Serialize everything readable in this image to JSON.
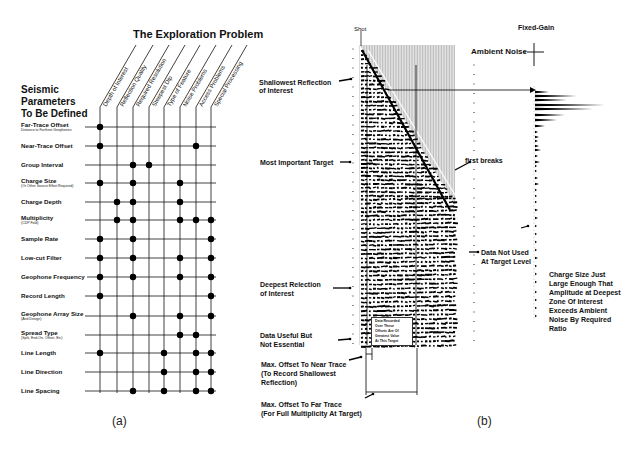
{
  "panel_a": {
    "title": "The Exploration Problem",
    "side_title": [
      "Seismic",
      "Parameters",
      "To Be Defined"
    ],
    "caption": "(a)",
    "columns": [
      {
        "label": "Depth of Interest",
        "x": 100
      },
      {
        "label": "Reflection Quality",
        "x": 117
      },
      {
        "label": "Required Resolution",
        "x": 133
      },
      {
        "label": "Steepest Dip",
        "x": 149
      },
      {
        "label": "Type of Feature",
        "x": 164
      },
      {
        "label": "Noise Problems",
        "x": 180
      },
      {
        "label": "Access Problems",
        "x": 196
      },
      {
        "label": "Special Processing",
        "x": 211
      }
    ],
    "rows": [
      {
        "label": "Far-Trace Offset",
        "sub": "Distance to Farthest Geophones",
        "y": 127,
        "dots": [
          0
        ]
      },
      {
        "label": "Near-Trace Offset",
        "sub": "",
        "y": 146,
        "dots": [
          0,
          6
        ]
      },
      {
        "label": "Group Interval",
        "sub": "",
        "y": 165,
        "dots": [
          2,
          3
        ]
      },
      {
        "label": "Charge Size",
        "sub": "(Or Other Source Effort Required)",
        "y": 183,
        "dots": [
          0,
          2,
          5
        ]
      },
      {
        "label": "Charge Depth",
        "sub": "",
        "y": 202,
        "dots": [
          1,
          2,
          5
        ]
      },
      {
        "label": "Multiplicity",
        "sub": "(CDP Fold)",
        "y": 220,
        "dots": [
          1,
          2,
          5,
          6,
          7
        ]
      },
      {
        "label": "Sample Rate",
        "sub": "",
        "y": 239,
        "dots": [
          0,
          2,
          7
        ]
      },
      {
        "label": "Low-cut Filter",
        "sub": "",
        "y": 258,
        "dots": [
          0,
          2,
          5,
          7
        ]
      },
      {
        "label": "Geophone Frequency",
        "sub": "",
        "y": 277,
        "dots": [
          0,
          2,
          5,
          7
        ]
      },
      {
        "label": "Record Length",
        "sub": "",
        "y": 296,
        "dots": [
          0,
          7
        ]
      },
      {
        "label": "Geophone Array Size",
        "sub": "(And Design)",
        "y": 316,
        "dots": [
          2,
          5,
          7
        ]
      },
      {
        "label": "Spread Type",
        "sub": "(Split, End-On, Offset, Etc)",
        "y": 335,
        "dots": [
          5,
          6
        ]
      },
      {
        "label": "Line Length",
        "sub": "",
        "y": 353,
        "dots": [
          0,
          4,
          6,
          7
        ]
      },
      {
        "label": "Line Direction",
        "sub": "",
        "y": 372,
        "dots": [
          4,
          6,
          7
        ]
      },
      {
        "label": "Line Spacing",
        "sub": "",
        "y": 391,
        "dots": [
          2,
          4,
          6,
          7
        ]
      }
    ]
  },
  "panel_b": {
    "caption": "(b)",
    "shot_label": "Shot",
    "fixed_gain_label": "Fixed-Gain",
    "ambient_noise_label": "Ambient Noise",
    "first_breaks_label": "first breaks",
    "annotations": {
      "shallowest": [
        "Shallowest Reflection",
        "of Interest"
      ],
      "most_important": [
        "Most Important Target"
      ],
      "deepest": [
        "Deepest Relection",
        "of Interest"
      ],
      "useful": [
        "Data Useful But",
        "Not Essential"
      ],
      "near_trace": [
        "Max. Offset To Near Trace",
        "(To Record Shallowest",
        "Reflection)"
      ],
      "far_trace": [
        "Max. Offset To Far Trace",
        "(For Full Multiplicity At Target)"
      ],
      "not_used": [
        "Data Not Used",
        "At Target Level"
      ],
      "charge_size": [
        "Charge Size Just",
        "Large Enough That",
        "Amplitude at Deepest",
        "Zone Of Interest",
        "Exceeds Ambient",
        "Noise By Required",
        "Ratio"
      ],
      "inset_box": [
        "Data Recorded",
        "Over These",
        "Offsets Are Of",
        "Greatest Value",
        "At This Target"
      ]
    }
  }
}
